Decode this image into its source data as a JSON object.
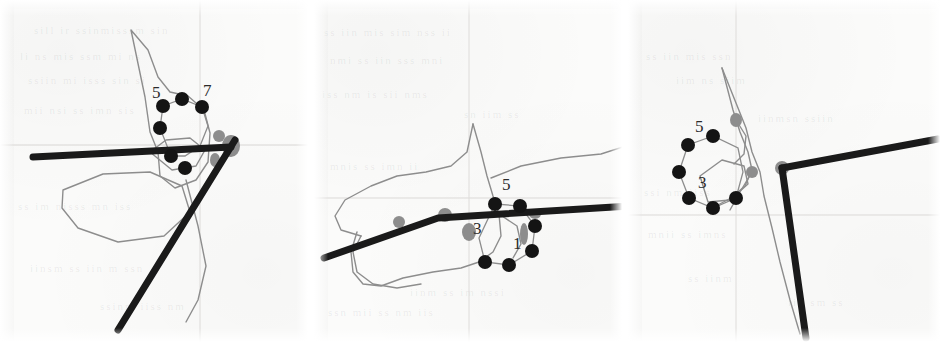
{
  "figure": {
    "kind": "scanned-diagram-triptych",
    "panel_count": 3,
    "background_color": "#fbfbfa",
    "ink_dark": "#1a1a1a",
    "ink_gray": "#8d8d8d",
    "ink_faint": "#cfcfcf",
    "node_color": "#141414"
  },
  "panels": [
    {
      "id": "panel-left",
      "labels": [
        {
          "text": "5",
          "x": 152,
          "y": 98
        },
        {
          "text": "7",
          "x": 203,
          "y": 96
        }
      ],
      "nodes": [
        {
          "x": 163,
          "y": 106
        },
        {
          "x": 182,
          "y": 99
        },
        {
          "x": 202,
          "y": 107
        },
        {
          "x": 160,
          "y": 128
        },
        {
          "x": 171,
          "y": 156
        },
        {
          "x": 185,
          "y": 168
        }
      ],
      "ring_path": "M163,106 L182,99 L202,107 L208,126 L200,146 L185,156 L171,156 L160,128 Z",
      "bold_polylines": [
        "M33,157 L231,147",
        "M235,140 L118,330"
      ],
      "gray_blobs": [
        {
          "cx": 231,
          "cy": 146,
          "rx": 9,
          "ry": 11
        },
        {
          "cx": 219,
          "cy": 136,
          "rx": 6,
          "ry": 6
        },
        {
          "cx": 215,
          "cy": 160,
          "rx": 5,
          "ry": 7
        }
      ],
      "gray_outlines": [
        "M131,30 L145,97 L150,132 L158,152 L160,176 L175,188 L196,180 L208,162 L210,133 L204,110 L188,96 L170,92 L158,77 L148,50 Z",
        "M63,190 L103,174 L150,172 L182,186 L190,212 L164,236 L118,242 L78,228 L62,208 Z",
        "M150,152 L166,140 L190,138 L205,150 L196,166 L172,170 Z",
        "M186,180 L198,226 L206,266 L198,300 L186,322"
      ]
    },
    {
      "id": "panel-middle",
      "labels": [
        {
          "text": "5",
          "x": 501,
          "y": 190
        },
        {
          "text": "3",
          "x": 472,
          "y": 234
        },
        {
          "text": "1",
          "x": 512,
          "y": 249
        }
      ],
      "nodes": [
        {
          "x": 494,
          "y": 204
        },
        {
          "x": 519,
          "y": 206
        },
        {
          "x": 534,
          "y": 226
        },
        {
          "x": 531,
          "y": 251
        },
        {
          "x": 508,
          "y": 265
        },
        {
          "x": 484,
          "y": 262
        }
      ],
      "ring_path": "M494,204 L519,206 L534,226 L531,251 L508,265 L484,262 L478,238 Z",
      "bold_polylines": [
        "M323,258 L437,218 L628,206"
      ],
      "gray_blobs": [
        {
          "cx": 444,
          "cy": 215,
          "rx": 7,
          "ry": 7
        },
        {
          "cx": 468,
          "cy": 232,
          "rx": 7,
          "ry": 9
        },
        {
          "cx": 523,
          "cy": 234,
          "rx": 4,
          "ry": 11
        },
        {
          "cx": 398,
          "cy": 222,
          "rx": 6,
          "ry": 6
        },
        {
          "cx": 534,
          "cy": 214,
          "rx": 6,
          "ry": 5
        }
      ],
      "gray_outlines": [
        "M472,124 L466,152 L450,166 L425,172 L396,176 L370,186 L344,200 L334,216 L340,230 L360,236",
        "M472,124 L480,152 L486,176 L492,196 L498,214 L500,236 L492,252 L478,262 L460,268 L432,272 L402,278 L380,286 L362,284 L352,272 L350,252 L356,232",
        "M490,178 L520,166 L560,158 L600,154 L625,146 L640,138",
        "M360,236 L352,252 L356,272 L372,284 L396,288 L420,284",
        "M498,214 L516,226 L520,244 L512,258"
      ]
    },
    {
      "id": "panel-right",
      "labels": [
        {
          "text": "5",
          "x": 695,
          "y": 132
        },
        {
          "text": "3",
          "x": 698,
          "y": 188
        }
      ],
      "nodes": [
        {
          "x": 713,
          "y": 136
        },
        {
          "x": 688,
          "y": 145
        },
        {
          "x": 679,
          "y": 172
        },
        {
          "x": 689,
          "y": 198
        },
        {
          "x": 713,
          "y": 208
        },
        {
          "x": 736,
          "y": 198
        }
      ],
      "ring_path": "M713,136 L688,145 L679,172 L689,198 L713,208 L736,198 L743,172 L738,148 Z",
      "bold_polylines": [
        "M782,168 L938,139",
        "M782,168 L806,338"
      ],
      "gray_blobs": [
        {
          "cx": 782,
          "cy": 168,
          "rx": 7,
          "ry": 7
        },
        {
          "cx": 736,
          "cy": 120,
          "rx": 6,
          "ry": 7
        },
        {
          "cx": 752,
          "cy": 172,
          "rx": 6,
          "ry": 6
        }
      ],
      "gray_outlines": [
        "M722,68 L733,110 L740,132 L748,152 L752,170 L745,186 L731,198 L716,206",
        "M722,68 L746,128 L752,152 L760,172 L764,196 L772,228 L780,262 L790,300 L800,334",
        "M700,176 L722,160 L744,166 L748,184 L730,200 L708,202 Z",
        "M736,120 L746,136 L744,154 L734,164",
        "M752,172 L740,192 L730,210"
      ]
    }
  ]
}
